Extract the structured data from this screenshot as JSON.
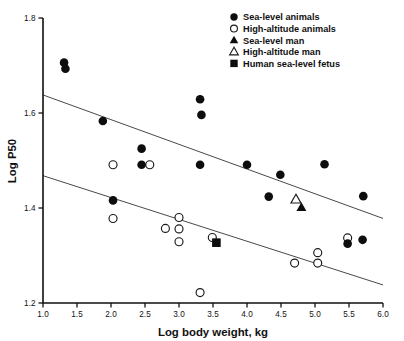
{
  "chart_data": {
    "type": "scatter",
    "title": "",
    "xlabel": "Log body weight, kg",
    "ylabel": "Log P50",
    "xlim": [
      1.0,
      6.0
    ],
    "ylim": [
      1.2,
      1.8
    ],
    "grid": false,
    "xticks": [
      "1.0",
      "1.5",
      "2.0",
      "2.5",
      "3.0",
      "3.5",
      "4.0",
      "4.5",
      "5.0",
      "5.5",
      "6.0"
    ],
    "xtick_values": [
      1.0,
      1.5,
      2.0,
      2.5,
      3.0,
      3.5,
      4.0,
      4.5,
      5.0,
      5.5,
      6.0
    ],
    "yticks": [
      "1.2",
      "1.4",
      "1.6",
      "1.8"
    ],
    "ytick_values": [
      1.2,
      1.4,
      1.6,
      1.8
    ],
    "legend_position": "top-right",
    "series": [
      {
        "name": "Sea-level animals",
        "marker": "filled-circle",
        "color": "#0d0d0d",
        "points": [
          [
            1.31,
            1.706
          ],
          [
            1.33,
            1.693
          ],
          [
            1.88,
            1.583
          ],
          [
            2.45,
            1.525
          ],
          [
            2.45,
            1.491
          ],
          [
            3.31,
            1.629
          ],
          [
            3.33,
            1.596
          ],
          [
            3.31,
            1.491
          ],
          [
            4.0,
            1.491
          ],
          [
            4.32,
            1.424
          ],
          [
            4.49,
            1.47
          ],
          [
            5.14,
            1.492
          ],
          [
            5.48,
            1.325
          ],
          [
            5.7,
            1.333
          ],
          [
            5.71,
            1.425
          ],
          [
            2.03,
            1.416
          ]
        ]
      },
      {
        "name": "High-altitude animals",
        "marker": "open-circle",
        "color": "#ffffff",
        "points": [
          [
            2.03,
            1.491
          ],
          [
            2.57,
            1.491
          ],
          [
            2.03,
            1.378
          ],
          [
            2.8,
            1.357
          ],
          [
            3.0,
            1.38
          ],
          [
            3.0,
            1.356
          ],
          [
            3.0,
            1.329
          ],
          [
            3.31,
            1.222
          ],
          [
            3.49,
            1.338
          ],
          [
            4.7,
            1.284
          ],
          [
            5.04,
            1.306
          ],
          [
            5.04,
            1.284
          ],
          [
            5.48,
            1.337
          ]
        ]
      },
      {
        "name": "Sea-level man",
        "marker": "filled-triangle",
        "color": "#0d0d0d",
        "points": [
          [
            4.8,
            1.401
          ]
        ]
      },
      {
        "name": "High-altitude man",
        "marker": "open-triangle",
        "color": "#ffffff",
        "points": [
          [
            4.72,
            1.418
          ]
        ]
      },
      {
        "name": "Human sea-level fetus",
        "marker": "filled-square",
        "color": "#0d0d0d",
        "points": [
          [
            3.55,
            1.327
          ]
        ]
      }
    ],
    "fit_lines": [
      {
        "name": "sea-level-regression",
        "x": [
          1.0,
          6.0
        ],
        "y": [
          1.638,
          1.378
        ]
      },
      {
        "name": "high-altitude-regression",
        "x": [
          1.0,
          6.0
        ],
        "y": [
          1.468,
          1.238
        ]
      }
    ]
  },
  "legend": {
    "items": [
      {
        "label": "Sea-level animals",
        "marker": "filled-circle"
      },
      {
        "label": "High-altitude animals",
        "marker": "open-circle"
      },
      {
        "label": "Sea-level man",
        "marker": "filled-triangle"
      },
      {
        "label": "High-altitude man",
        "marker": "open-triangle"
      },
      {
        "label": "Human sea-level fetus",
        "marker": "filled-square"
      }
    ]
  }
}
